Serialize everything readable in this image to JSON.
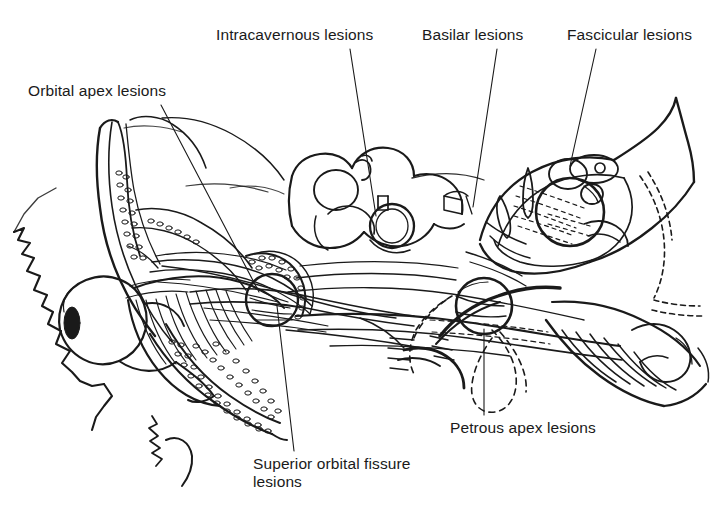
{
  "figure": {
    "kind": "anatomical-line-drawing",
    "background_color": "#ffffff",
    "ink_color": "#1a1a1a",
    "width": 721,
    "height": 512
  },
  "labels": [
    {
      "id": "orbital-apex",
      "text": "Orbital apex lesions",
      "x": 28,
      "y": 82,
      "lines": 1
    },
    {
      "id": "intracavernous",
      "text": "Intracavernous lesions",
      "x": 216,
      "y": 26,
      "lines": 1
    },
    {
      "id": "basilar",
      "text": "Basilar lesions",
      "x": 422,
      "y": 26,
      "lines": 1
    },
    {
      "id": "fascicular",
      "text": "Fascicular lesions",
      "x": 567,
      "y": 26,
      "lines": 1
    },
    {
      "id": "petrous-apex",
      "text": "Petrous apex lesions",
      "x": 450,
      "y": 419,
      "lines": 1
    },
    {
      "id": "superior-orbital-fissure",
      "text": "Superior orbital fissure\nlesions",
      "x": 253,
      "y": 455,
      "lines": 2
    }
  ],
  "leader_lines": [
    {
      "id": "leader-orbital-apex",
      "from": [
        161,
        105
      ],
      "to": [
        259,
        292
      ],
      "style": "solid"
    },
    {
      "id": "leader-intracavernous",
      "from": [
        350,
        49
      ],
      "to": [
        376,
        216
      ],
      "style": "solid"
    },
    {
      "id": "leader-basilar",
      "from": [
        497,
        49
      ],
      "to": [
        473,
        207
      ],
      "style": "solid"
    },
    {
      "id": "leader-fascicular",
      "from": [
        596,
        49
      ],
      "to": [
        570,
        166
      ],
      "style": "solid"
    },
    {
      "id": "leader-petrous-apex",
      "from": [
        484,
        329
      ],
      "to": [
        484,
        415
      ],
      "style": "solid"
    },
    {
      "id": "leader-superior-orbital-fissure",
      "from": [
        277,
        306
      ],
      "to": [
        294,
        451
      ],
      "style": "solid"
    }
  ],
  "anatomy_parts": [
    {
      "id": "facial-profile",
      "label": "facial profile and brow"
    },
    {
      "id": "globe",
      "label": "eyeball (globe) with pupil"
    },
    {
      "id": "orbital-roof",
      "label": "orbital roof / frontal bone"
    },
    {
      "id": "orbital-bone-marrow",
      "label": "cancellous bone stipple"
    },
    {
      "id": "extraocular-muscle-cone",
      "label": "extraocular muscle cone"
    },
    {
      "id": "optic-nerve",
      "label": "optic nerve"
    },
    {
      "id": "superior-orbital-fissure-ring",
      "label": "superior orbital fissure"
    },
    {
      "id": "cavernous-sinus",
      "label": "cavernous sinus / sphenoid body"
    },
    {
      "id": "internal-carotid",
      "label": "internal carotid artery loop"
    },
    {
      "id": "petrous-apex-ring",
      "label": "petrous apex"
    },
    {
      "id": "basilar-artery",
      "label": "basilar artery region"
    },
    {
      "id": "brainstem-section",
      "label": "midbrain cross-section"
    },
    {
      "id": "oculomotor-nucleus",
      "label": "oculomotor nucleus complex"
    },
    {
      "id": "red-nucleus",
      "label": "red nucleus"
    },
    {
      "id": "cerebral-aqueduct",
      "label": "cerebral aqueduct"
    },
    {
      "id": "cerebellum",
      "label": "cerebellum / tentorium"
    },
    {
      "id": "nerve-fascicles",
      "label": "nerve fascicles"
    },
    {
      "id": "dashed-nerve-course",
      "label": "dashed nerve course"
    }
  ]
}
